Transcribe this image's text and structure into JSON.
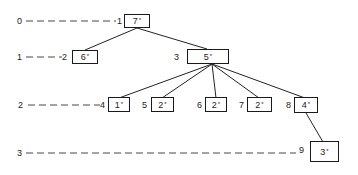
{
  "levels": [
    {
      "label": "0",
      "y": 21
    },
    {
      "label": "1",
      "y": 57
    },
    {
      "label": "2",
      "y": 104
    },
    {
      "label": "3",
      "y": 153
    }
  ],
  "nodes": [
    {
      "id": "1",
      "value": "7",
      "mark": "*",
      "level": 0
    },
    {
      "id": "2",
      "value": "6",
      "mark": "*",
      "level": 1
    },
    {
      "id": "3",
      "value": "5",
      "mark": "*",
      "level": 1
    },
    {
      "id": "4",
      "value": "1",
      "mark": "*",
      "level": 2
    },
    {
      "id": "5",
      "value": "2",
      "mark": "*",
      "level": 2
    },
    {
      "id": "6",
      "value": "2",
      "mark": "*",
      "level": 2
    },
    {
      "id": "7",
      "value": "2",
      "mark": "*",
      "level": 2
    },
    {
      "id": "8",
      "value": "4",
      "mark": "*",
      "level": 2
    },
    {
      "id": "9",
      "value": "3",
      "mark": "*",
      "level": 3
    }
  ],
  "edges": [
    [
      "1",
      "2"
    ],
    [
      "1",
      "3"
    ],
    [
      "3",
      "4"
    ],
    [
      "3",
      "5"
    ],
    [
      "3",
      "6"
    ],
    [
      "3",
      "7"
    ],
    [
      "3",
      "8"
    ],
    [
      "8",
      "9"
    ]
  ]
}
